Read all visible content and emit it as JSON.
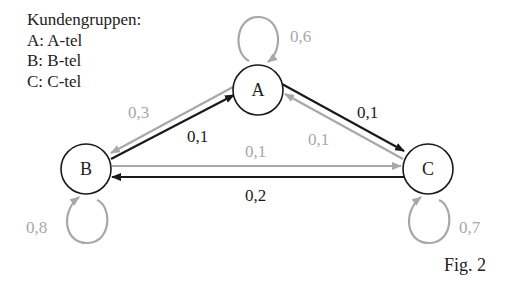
{
  "legend": {
    "title": "Kundengruppen:",
    "items": [
      "A: A-tel",
      "B: B-tel",
      "C: C-tel"
    ]
  },
  "colors": {
    "black": "#1a1a1a",
    "gray": "#a8a8a8"
  },
  "nodes": [
    {
      "id": "A",
      "label": "A"
    },
    {
      "id": "B",
      "label": "B"
    },
    {
      "id": "C",
      "label": "C"
    }
  ],
  "edges": [
    {
      "from": "A",
      "to": "A",
      "label": "0,6",
      "color": "gray"
    },
    {
      "from": "B",
      "to": "B",
      "label": "0,8",
      "color": "gray"
    },
    {
      "from": "C",
      "to": "C",
      "label": "0,7",
      "color": "gray"
    },
    {
      "from": "A",
      "to": "B",
      "label": "0,3",
      "color": "gray"
    },
    {
      "from": "B",
      "to": "A",
      "label": "0,1",
      "color": "black"
    },
    {
      "from": "A",
      "to": "C",
      "label": "0,1",
      "color": "black"
    },
    {
      "from": "C",
      "to": "A",
      "label": "0,1",
      "color": "gray"
    },
    {
      "from": "B",
      "to": "C",
      "label": "0,1",
      "color": "gray"
    },
    {
      "from": "C",
      "to": "B",
      "label": "0,2",
      "color": "black"
    }
  ],
  "caption": "Fig. 2"
}
